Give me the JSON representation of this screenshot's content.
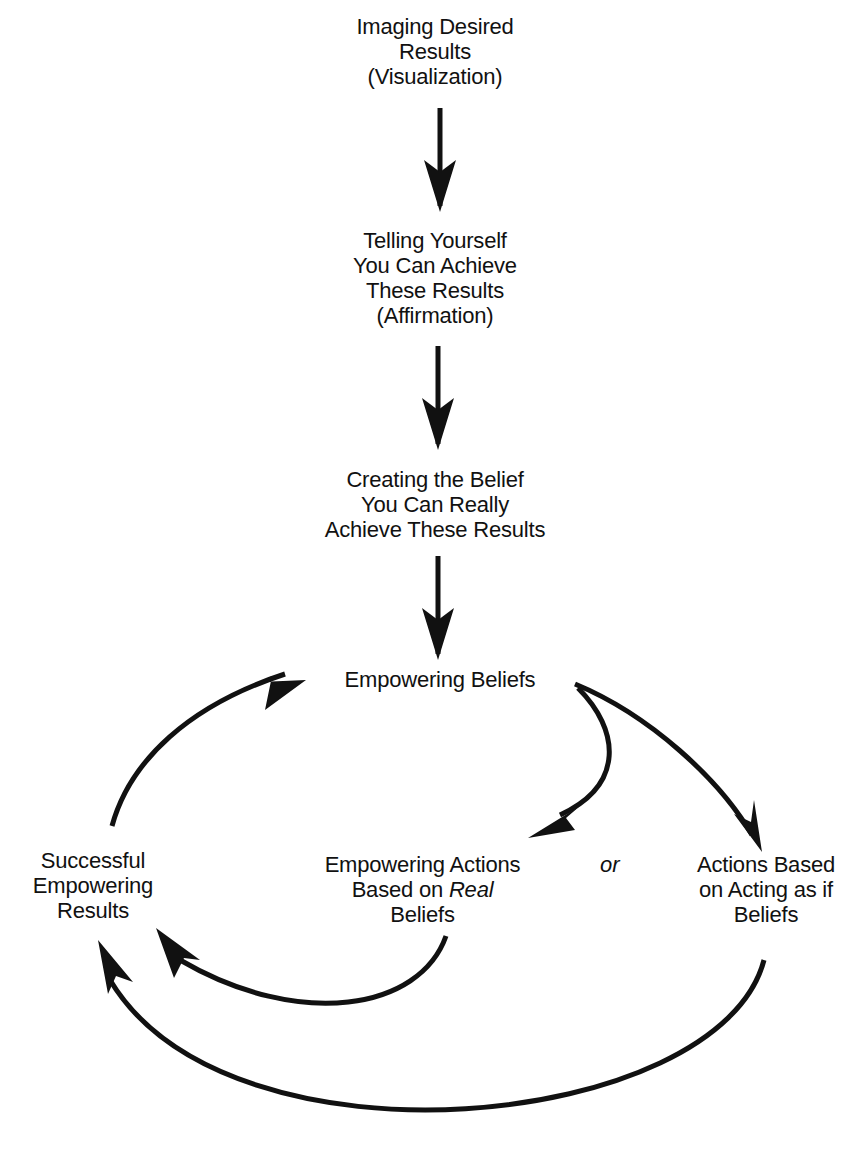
{
  "diagram": {
    "nodes": {
      "visualization": {
        "lines": [
          "Imaging Desired",
          "Results",
          "(Visualization)"
        ]
      },
      "affirmation": {
        "lines": [
          "Telling Yourself",
          "You Can Achieve",
          "These Results",
          "(Affirmation)"
        ]
      },
      "belief_creation": {
        "lines": [
          "Creating the Belief",
          "You Can Really",
          "Achieve These Results"
        ]
      },
      "empowering_beliefs": {
        "lines": [
          "Empowering Beliefs"
        ]
      },
      "successful_results": {
        "lines": [
          "Successful",
          "Empowering",
          "Results"
        ]
      },
      "empowering_actions": {
        "line1": "Empowering Actions",
        "line2_prefix": "Based on ",
        "line2_italic": "Real",
        "line3": "Beliefs"
      },
      "acting_as_if": {
        "lines": [
          "Actions Based",
          "on Acting as if",
          "Beliefs"
        ]
      }
    },
    "connector_label": "or",
    "edges": [
      {
        "from": "visualization",
        "to": "affirmation"
      },
      {
        "from": "affirmation",
        "to": "belief_creation"
      },
      {
        "from": "belief_creation",
        "to": "empowering_beliefs"
      },
      {
        "from": "empowering_beliefs",
        "to": "empowering_actions"
      },
      {
        "from": "empowering_beliefs",
        "to": "acting_as_if"
      },
      {
        "from": "empowering_actions",
        "to": "successful_results"
      },
      {
        "from": "acting_as_if",
        "to": "successful_results"
      },
      {
        "from": "successful_results",
        "to": "empowering_beliefs"
      }
    ],
    "colors": {
      "ink": "#111111",
      "background": "#ffffff"
    }
  }
}
